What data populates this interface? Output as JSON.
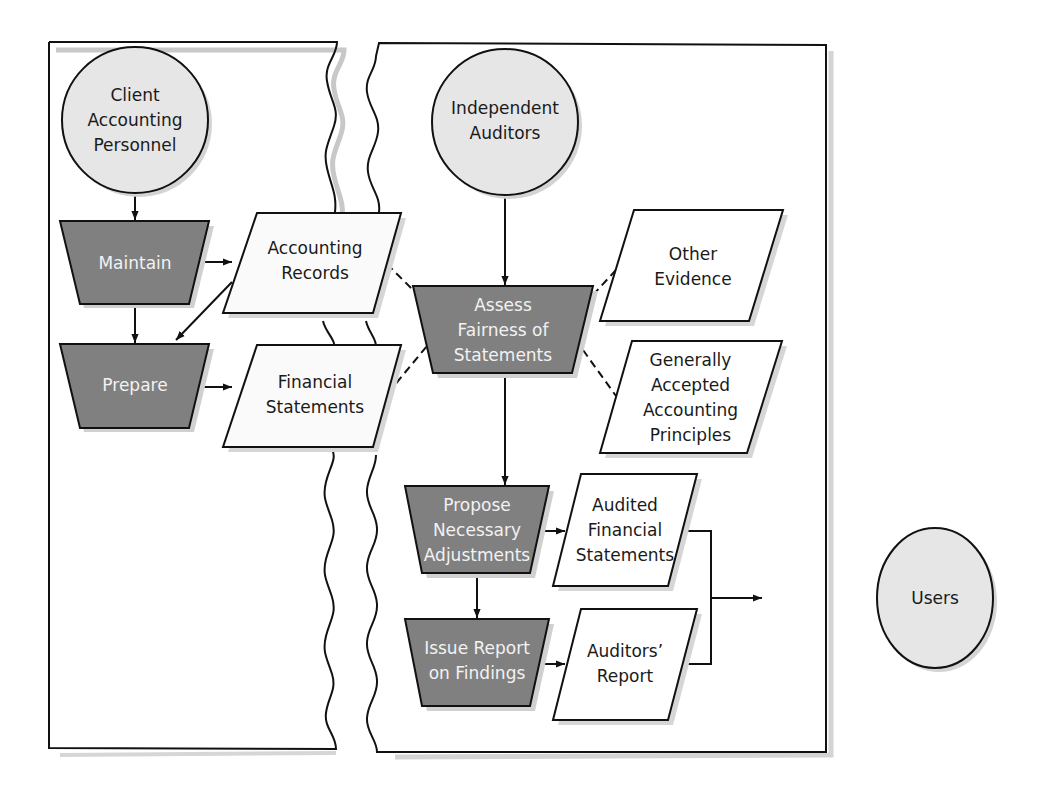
{
  "diagram": {
    "type": "process-flowchart",
    "colors": {
      "entity_fill": "#e6e6e6",
      "process_fill": "#7f7f7f",
      "document_fill": "#ffffff",
      "stroke": "#111111",
      "shadow": "#d0d0d0",
      "process_text": "#f2f2f2",
      "text": "#1a1a1a"
    },
    "entities": {
      "client": {
        "lines": [
          "Client",
          "Accounting",
          "Personnel"
        ]
      },
      "auditors": {
        "lines": [
          "Independent",
          "Auditors"
        ]
      },
      "users": {
        "lines": [
          "Users"
        ]
      }
    },
    "processes": {
      "maintain": {
        "lines": [
          "Maintain"
        ]
      },
      "prepare": {
        "lines": [
          "Prepare"
        ]
      },
      "assess": {
        "lines": [
          "Assess",
          "Fairness of",
          "Statements"
        ]
      },
      "propose": {
        "lines": [
          "Propose",
          "Necessary",
          "Adjustments"
        ]
      },
      "issue": {
        "lines": [
          "Issue Report",
          "on Findings"
        ]
      }
    },
    "documents": {
      "accounting_records": {
        "lines": [
          "Accounting",
          "Records"
        ]
      },
      "financial_statements": {
        "lines": [
          "Financial",
          "Statements"
        ]
      },
      "other_evidence": {
        "lines": [
          "Other",
          "Evidence"
        ]
      },
      "gaap": {
        "lines": [
          "Generally",
          "Accepted",
          "Accounting",
          "Principles"
        ]
      },
      "audited_fs": {
        "lines": [
          "Audited",
          "Financial",
          "Statements"
        ]
      },
      "auditors_report": {
        "lines": [
          "Auditors’",
          "Report"
        ]
      }
    },
    "connections": [
      {
        "from": "Client Accounting Personnel",
        "to": "Maintain",
        "style": "arrow"
      },
      {
        "from": "Maintain",
        "to": "Accounting Records",
        "style": "arrow"
      },
      {
        "from": "Maintain",
        "to": "Prepare",
        "style": "arrow"
      },
      {
        "from": "Accounting Records",
        "to": "Prepare",
        "style": "arrow"
      },
      {
        "from": "Prepare",
        "to": "Financial Statements",
        "style": "arrow"
      },
      {
        "from": "Independent Auditors",
        "to": "Assess Fairness of Statements",
        "style": "arrow"
      },
      {
        "from": "Accounting Records",
        "to": "Assess Fairness of Statements",
        "style": "dashed"
      },
      {
        "from": "Financial Statements",
        "to": "Assess Fairness of Statements",
        "style": "dashed"
      },
      {
        "from": "Other Evidence",
        "to": "Assess Fairness of Statements",
        "style": "dashed"
      },
      {
        "from": "Generally Accepted Accounting Principles",
        "to": "Assess Fairness of Statements",
        "style": "dashed"
      },
      {
        "from": "Assess Fairness of Statements",
        "to": "Propose Necessary Adjustments",
        "style": "arrow"
      },
      {
        "from": "Propose Necessary Adjustments",
        "to": "Audited Financial Statements",
        "style": "arrow"
      },
      {
        "from": "Propose Necessary Adjustments",
        "to": "Issue Report on Findings",
        "style": "arrow"
      },
      {
        "from": "Issue Report on Findings",
        "to": "Auditors’ Report",
        "style": "arrow"
      },
      {
        "from": "Audited Financial Statements",
        "to": "Users",
        "style": "arrow"
      },
      {
        "from": "Auditors’ Report",
        "to": "Users",
        "style": "arrow"
      }
    ]
  }
}
